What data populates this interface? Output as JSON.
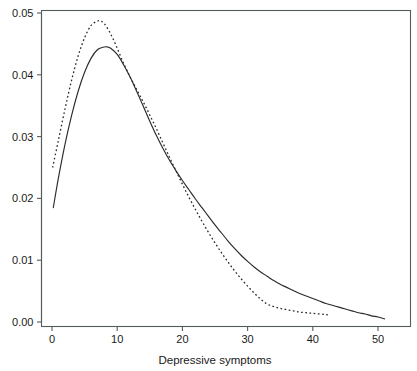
{
  "chart_data": {
    "type": "line",
    "title": "",
    "subtitle": "",
    "xlabel": "Depressive symptoms",
    "ylabel": "",
    "xlim": [
      -1.5,
      54
    ],
    "ylim": [
      -0.0008,
      0.0505
    ],
    "xticks": [
      0,
      10,
      20,
      30,
      40,
      50
    ],
    "xtick_labels": [
      "0",
      "10",
      "20",
      "30",
      "40",
      "50"
    ],
    "yticks": [
      0.0,
      0.01,
      0.02,
      0.03,
      0.04,
      0.05
    ],
    "ytick_labels": [
      "0.00",
      "0.01",
      "0.02",
      "0.03",
      "0.04",
      "0.05"
    ],
    "grid": false,
    "legend": "none",
    "frame": "box",
    "series": [
      {
        "name": "solid-density",
        "style": "solid",
        "color": "#2b2b2b",
        "x": [
          0.2,
          1,
          2,
          3,
          4,
          5,
          6,
          7,
          8,
          8.5,
          9,
          10,
          11,
          12,
          13,
          14,
          15,
          16,
          17,
          18,
          19,
          20,
          21,
          22,
          23,
          24,
          25,
          26,
          27,
          28,
          29,
          30,
          31,
          32,
          33,
          34,
          35,
          36,
          37,
          38,
          39,
          40,
          41,
          42,
          43,
          44,
          45,
          46,
          47,
          48,
          49,
          50,
          51
        ],
        "y": [
          0.0185,
          0.0234,
          0.0288,
          0.0334,
          0.0373,
          0.0404,
          0.0427,
          0.0441,
          0.0445,
          0.0445,
          0.0443,
          0.0433,
          0.0416,
          0.0396,
          0.0373,
          0.0349,
          0.0325,
          0.0302,
          0.0281,
          0.0262,
          0.0245,
          0.0229,
          0.0214,
          0.0199,
          0.0185,
          0.0171,
          0.0157,
          0.0144,
          0.0131,
          0.0119,
          0.0108,
          0.0098,
          0.0089,
          0.0081,
          0.0074,
          0.0067,
          0.0061,
          0.0056,
          0.0051,
          0.0046,
          0.0042,
          0.0038,
          0.0034,
          0.003,
          0.0027,
          0.0024,
          0.0021,
          0.0018,
          0.0015,
          0.0013,
          0.001,
          0.0008,
          0.0005
        ]
      },
      {
        "name": "dashed-density",
        "style": "dashed",
        "color": "#2b2b2b",
        "x": [
          0.1,
          1,
          2,
          3,
          4,
          5,
          6,
          7,
          7.4,
          8,
          9,
          10,
          11,
          12,
          13,
          14,
          15,
          16,
          17,
          18,
          19,
          20,
          21,
          22,
          23,
          24,
          25,
          26,
          27,
          28,
          29,
          30,
          31,
          32,
          33,
          34,
          35,
          36,
          37,
          38,
          39,
          40,
          41,
          42,
          42.6
        ],
        "y": [
          0.025,
          0.0295,
          0.0345,
          0.0391,
          0.043,
          0.046,
          0.048,
          0.0487,
          0.0487,
          0.0483,
          0.0466,
          0.0443,
          0.0418,
          0.0396,
          0.0376,
          0.0356,
          0.0335,
          0.0313,
          0.029,
          0.0267,
          0.0245,
          0.0223,
          0.0202,
          0.0182,
          0.0163,
          0.0145,
          0.0128,
          0.0112,
          0.0097,
          0.0083,
          0.007,
          0.0058,
          0.0047,
          0.0037,
          0.0029,
          0.0025,
          0.0022,
          0.002,
          0.0018,
          0.0016,
          0.0015,
          0.0014,
          0.0013,
          0.0012,
          0.0011
        ]
      }
    ]
  }
}
